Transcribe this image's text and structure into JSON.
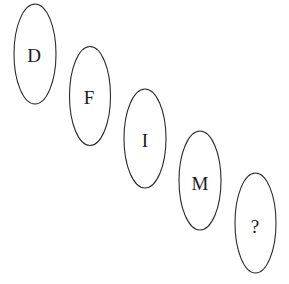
{
  "puzzle": {
    "items": [
      {
        "label": "D"
      },
      {
        "label": "F"
      },
      {
        "label": "I"
      },
      {
        "label": "M"
      },
      {
        "label": "?"
      }
    ]
  }
}
